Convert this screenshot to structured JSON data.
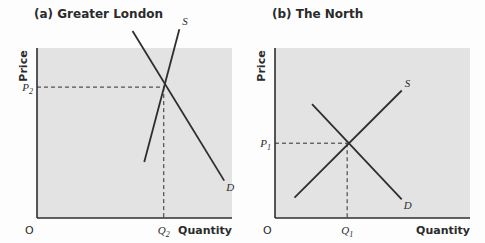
{
  "chart_data": [
    {
      "type": "line",
      "title": "(a) Greater London",
      "xlabel": "Quantity",
      "ylabel": "Price",
      "origin_label": "O",
      "xlim": [
        0,
        10
      ],
      "ylim": [
        0,
        10
      ],
      "grid": false,
      "shaded_plot_area": true,
      "series": [
        {
          "name": "D",
          "points": [
            [
              4.9,
              11
            ],
            [
              9.6,
              2.2
            ]
          ]
        },
        {
          "name": "S",
          "points": [
            [
              7.3,
              11.1
            ],
            [
              5.5,
              3.3
            ]
          ]
        }
      ],
      "equilibrium": {
        "x": 6.5,
        "y": 7.7,
        "x_label": "Q",
        "x_label_sub": "2",
        "y_label": "P",
        "y_label_sub": "2"
      }
    },
    {
      "type": "line",
      "title": "(b) The North",
      "xlabel": "Quantity",
      "ylabel": "Price",
      "origin_label": "O",
      "xlim": [
        0,
        10
      ],
      "ylim": [
        0,
        10
      ],
      "grid": false,
      "shaded_plot_area": true,
      "series": [
        {
          "name": "D",
          "points": [
            [
              1.9,
              6.7
            ],
            [
              6.5,
              1.1
            ]
          ]
        },
        {
          "name": "S",
          "points": [
            [
              1.0,
              1.2
            ],
            [
              6.5,
              7.5
            ]
          ]
        }
      ],
      "equilibrium": {
        "x": 3.7,
        "y": 4.4,
        "x_label": "Q",
        "x_label_sub": "1",
        "y_label": "P",
        "y_label_sub": "1"
      }
    }
  ],
  "colors": {
    "plot_bg": "#e3e3e3",
    "line": "#2e2e2e",
    "page_bg": "#fdfdfd"
  }
}
